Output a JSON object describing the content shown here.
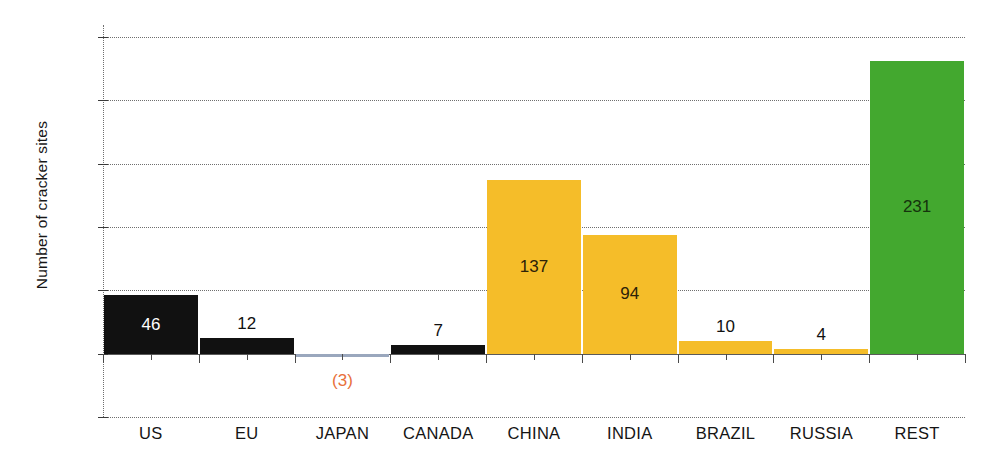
{
  "chart_data": {
    "type": "bar",
    "title": "",
    "xlabel": "",
    "ylabel": "Number of cracker sites",
    "categories": [
      "US",
      "EU",
      "JAPAN",
      "CANADA",
      "CHINA",
      "INDIA",
      "BRAZIL",
      "RUSSIA",
      "REST"
    ],
    "values": [
      46,
      12,
      -3,
      7,
      137,
      94,
      10,
      4,
      231
    ],
    "data_labels": [
      "46",
      "12",
      "(3)",
      "7",
      "137",
      "94",
      "10",
      "4",
      "231"
    ],
    "bar_colors": [
      "#111111",
      "#111111",
      "#9aa7bd",
      "#111111",
      "#f5bd29",
      "#f5bd29",
      "#f5bd29",
      "#f5bd29",
      "#43a82f"
    ],
    "label_colors": [
      "#ffffff",
      "#111111",
      "#e8703a",
      "#111111",
      "#2d2208",
      "#2d2208",
      "#111111",
      "#111111",
      "#14330c"
    ],
    "ylim": [
      -50,
      250
    ],
    "yticks": [
      250,
      200,
      150,
      100,
      50,
      0,
      -50
    ],
    "ytick_labels": [
      "250",
      "200",
      "150",
      "100",
      "50",
      "–",
      "(50)"
    ],
    "grid": true,
    "legend": "none",
    "axis_style": "dotted-gridlines"
  },
  "title_fragment": "",
  "axis": {
    "y_title": "Number of cracker sites"
  }
}
